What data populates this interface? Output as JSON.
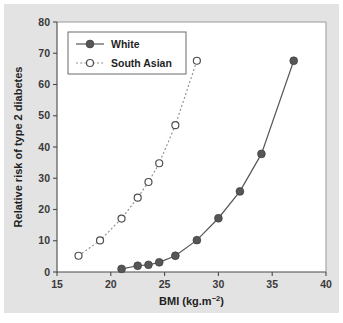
{
  "figure": {
    "background_color": "#e3e3e3",
    "plot_background_color": "#ffffff"
  },
  "chart_data": {
    "type": "line",
    "title": "",
    "xlabel_prefix": "BMI (kg.m",
    "xlabel_superscript": "−2",
    "xlabel_suffix": ")",
    "xlabel": "BMI (kg.m−2)",
    "ylabel": "Relative risk of type 2 diabetes",
    "xlim": [
      15,
      40
    ],
    "ylim": [
      0,
      80
    ],
    "xticks": [
      15,
      20,
      25,
      30,
      35,
      40
    ],
    "xtick_labels": [
      "15",
      "20",
      "25",
      "30",
      "35",
      "40"
    ],
    "yticks": [
      0,
      10,
      20,
      30,
      40,
      50,
      60,
      70,
      80
    ],
    "ytick_labels": [
      "0",
      "10",
      "20",
      "30",
      "40",
      "50",
      "60",
      "70",
      "80"
    ],
    "grid": false,
    "legend_position": "upper-left",
    "series": [
      {
        "name": "White",
        "marker": "filled-circle",
        "line_style": "solid",
        "color": "#565656",
        "x": [
          21.0,
          22.5,
          23.5,
          24.5,
          26.0,
          28.0,
          30.0,
          32.0,
          34.0,
          37.0
        ],
        "values": [
          1.0,
          2.0,
          2.3,
          3.1,
          5.2,
          10.2,
          17.2,
          25.8,
          37.8,
          67.6
        ]
      },
      {
        "name": "South Asian",
        "marker": "open-circle",
        "line_style": "dotted",
        "color": "#8d8d8d",
        "x": [
          17.0,
          19.0,
          21.0,
          22.5,
          23.5,
          24.5,
          26.0,
          28.0
        ],
        "values": [
          5.2,
          10.1,
          17.1,
          23.8,
          28.8,
          34.8,
          47.0,
          67.6
        ]
      }
    ]
  },
  "legend": {
    "entries": [
      {
        "label": "White"
      },
      {
        "label": "South Asian"
      }
    ]
  }
}
